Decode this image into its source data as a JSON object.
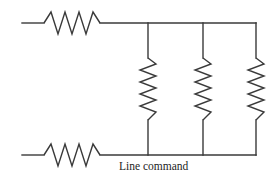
{
  "figure": {
    "kind": "electrical-circuit-schematic",
    "caption": "Line command",
    "background_color": "#ffffff",
    "line_color": "#3a3a3a",
    "label_color": "#1d1d1d",
    "canvas": {
      "width": 279,
      "height": 193
    }
  },
  "geometry": {
    "top_rail_y": 23,
    "bottom_rail_y": 155,
    "left_lead_x": 22,
    "right_rail_x": 256,
    "branch_x": [
      148,
      203,
      256
    ],
    "horizontal_resistor": {
      "start_x": 44,
      "end_x": 100,
      "cycles": 4,
      "amplitude": 11
    },
    "vertical_resistor": {
      "start_y": 58,
      "end_y": 120,
      "cycles": 5,
      "amplitude": 8
    }
  },
  "components": {
    "series_resistors": [
      {
        "name": "top-series-resistor",
        "orientation": "horizontal",
        "rail": "top"
      },
      {
        "name": "bottom-series-resistor",
        "orientation": "horizontal",
        "rail": "bottom"
      }
    ],
    "parallel_resistors": [
      {
        "name": "parallel-resistor-1",
        "orientation": "vertical",
        "branch_index": 0
      },
      {
        "name": "parallel-resistor-2",
        "orientation": "vertical",
        "branch_index": 1
      },
      {
        "name": "parallel-resistor-3",
        "orientation": "vertical",
        "branch_index": 2
      }
    ]
  },
  "labels": {
    "line_command": {
      "text": "Line command",
      "x": 119,
      "y": 170
    }
  }
}
